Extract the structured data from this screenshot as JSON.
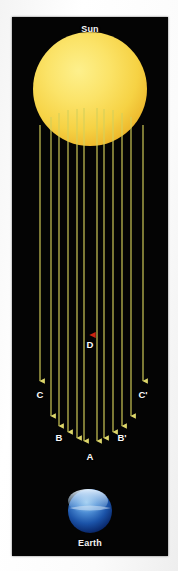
{
  "diagram": {
    "background_color": "#040404",
    "paper_color": "#f7f7f7"
  },
  "sun": {
    "label": "Sun",
    "cx": 78,
    "cy": 72,
    "r": 57,
    "color_core": "#fbe66a",
    "color_mid": "#f8d948",
    "color_edge": "#edb429"
  },
  "earth": {
    "label": "Earth",
    "cx": 78,
    "cy": 494,
    "r": 22,
    "color_ocean": "#123f93",
    "color_cloud": "#cfe3f7",
    "color_deep": "#03143f"
  },
  "axis_ray": {
    "label": "D",
    "color": "#c01a0c",
    "x": 78,
    "y_start": 14,
    "y_tip": 318,
    "label_x": 78,
    "label_y": 322
  },
  "rays": {
    "color": "#d6d05a",
    "y_start_top": 100,
    "labels": [
      {
        "name": "C",
        "x": 28,
        "y": 372
      },
      {
        "name": "B",
        "x": 47,
        "y": 415
      },
      {
        "name": "A",
        "x": 78,
        "y": 434
      },
      {
        "name": "B'",
        "x": 110,
        "y": 415
      },
      {
        "name": "C'",
        "x": 131,
        "y": 372
      }
    ],
    "lines": [
      {
        "x": 28,
        "y_start": 108,
        "y_tip": 364
      },
      {
        "x": 39,
        "y_start": 100,
        "y_tip": 399
      },
      {
        "x": 47,
        "y_start": 96,
        "y_tip": 409
      },
      {
        "x": 56,
        "y_start": 93,
        "y_tip": 415
      },
      {
        "x": 65,
        "y_start": 92,
        "y_tip": 421
      },
      {
        "x": 72,
        "y_start": 91,
        "y_tip": 424
      },
      {
        "x": 85,
        "y_start": 91,
        "y_tip": 424
      },
      {
        "x": 92,
        "y_start": 92,
        "y_tip": 421
      },
      {
        "x": 101,
        "y_start": 93,
        "y_tip": 415
      },
      {
        "x": 110,
        "y_start": 96,
        "y_tip": 409
      },
      {
        "x": 119,
        "y_start": 100,
        "y_tip": 399
      },
      {
        "x": 131,
        "y_start": 108,
        "y_tip": 364
      }
    ]
  }
}
